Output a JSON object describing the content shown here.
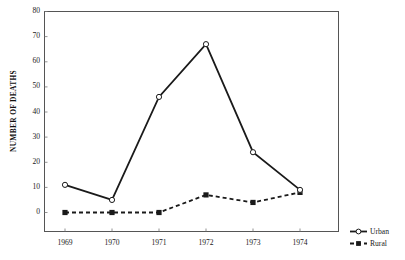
{
  "chart_data": {
    "type": "line",
    "title": "",
    "xlabel": "",
    "ylabel": "NUMBER OF DEATHS",
    "categories": [
      "1969",
      "1970",
      "1971",
      "1972",
      "1973",
      "1974"
    ],
    "series": [
      {
        "name": "Urban",
        "values": [
          11,
          5,
          46,
          67,
          24,
          9
        ],
        "marker": "open-circle",
        "line_style": "solid",
        "color": "#1a1a1a"
      },
      {
        "name": "Rural",
        "values": [
          0,
          0,
          0,
          7,
          4,
          8
        ],
        "marker": "filled-square",
        "line_style": "dashed",
        "color": "#1a1a1a"
      }
    ],
    "ylim": [
      0,
      80
    ],
    "ytick_values": [
      0,
      10,
      20,
      30,
      40,
      50,
      60,
      70,
      80
    ],
    "ytick_labels": [
      "0",
      "10",
      "20",
      "30",
      "40",
      "50",
      "60",
      "70",
      "80"
    ],
    "xtick_labels": [
      "1969",
      "1970",
      "1971",
      "1972",
      "1973",
      "1974"
    ],
    "grid": false,
    "legend_position": "right-bottom-outside",
    "frame": "box"
  },
  "legend": {
    "entries": [
      {
        "label": "Urban",
        "marker": "open-circle-icon",
        "line_style": "solid"
      },
      {
        "label": "Rural",
        "marker": "filled-square-icon",
        "line_style": "dashed"
      }
    ]
  }
}
